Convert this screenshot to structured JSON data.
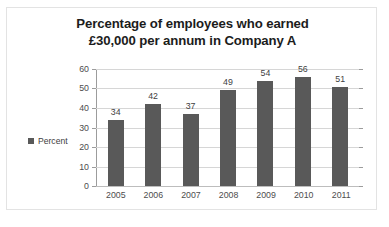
{
  "chart_data": {
    "type": "bar",
    "title": "Percentage of employees who earned £30,000 per annum in Company A",
    "title_lines": [
      "Percentage of employees who earned",
      "£30,000 per annum in Company A"
    ],
    "xlabel": "",
    "ylabel": "",
    "categories": [
      "2005",
      "2006",
      "2007",
      "2008",
      "2009",
      "2010",
      "2011"
    ],
    "values": [
      34,
      42,
      37,
      49,
      54,
      56,
      51
    ],
    "data_labels": [
      "34",
      "42",
      "37",
      "49",
      "54",
      "56",
      "51"
    ],
    "series": [
      {
        "name": "Percent",
        "values": [
          34,
          42,
          37,
          49,
          54,
          56,
          51
        ],
        "color": "#595959"
      }
    ],
    "ylim": [
      0,
      60
    ],
    "ytick_step": 10,
    "ytick_labels": [
      "60",
      "50",
      "40",
      "30",
      "20",
      "10",
      "0"
    ],
    "ytick_values": [
      60,
      50,
      40,
      30,
      20,
      10,
      0
    ],
    "grid": true,
    "grid_axis": "y",
    "legend": {
      "position": "left",
      "entries": [
        {
          "label": "Percent",
          "color": "#595959"
        }
      ]
    },
    "colors": {
      "bar": "#595959",
      "gridline": "#d6d6d6",
      "axis": "#9c9c9c",
      "title_text": "#1c1c1c",
      "tick_text": "#4d4d4d",
      "plot_background": "#ffffff",
      "frame_border": "#e3e3e3"
    }
  }
}
